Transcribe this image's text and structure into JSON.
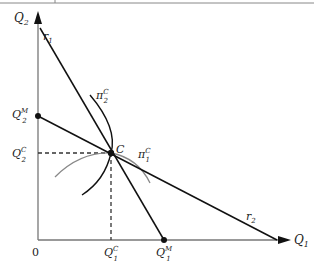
{
  "diagram": {
    "type": "reaction-function-cournot-equilibrium",
    "axes": {
      "x": {
        "label": "Q",
        "sub": "1"
      },
      "y": {
        "label": "Q",
        "sub": "2"
      },
      "origin_label": "0"
    },
    "lines": {
      "r1": {
        "label": "r",
        "sub": "1"
      },
      "r2": {
        "label": "r",
        "sub": "2"
      }
    },
    "curves": {
      "pi2": {
        "label": "π",
        "sup": "C",
        "sub": "2"
      },
      "pi1": {
        "label": "π",
        "sup": "C",
        "sub": "1"
      }
    },
    "points": {
      "C": {
        "label": "C"
      },
      "Q2M": {
        "label": "Q",
        "sup": "M",
        "sub": "2"
      },
      "Q2C": {
        "label": "Q",
        "sup": "C",
        "sub": "2"
      },
      "Q1C": {
        "label": "Q",
        "sup": "C",
        "sub": "1"
      },
      "Q1M": {
        "label": "Q",
        "sup": "M",
        "sub": "1"
      }
    }
  }
}
